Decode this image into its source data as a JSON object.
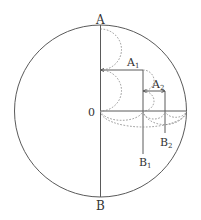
{
  "diagram": {
    "colors": {
      "stroke": "#5a5a5a",
      "dashed": "#8a8a8a",
      "text": "#333333",
      "background": "#ffffff"
    },
    "labels": {
      "A": "A",
      "B": "B",
      "O": "0",
      "A1_base": "A",
      "A1_sub": "1",
      "A2_base": "A",
      "A2_sub": "2",
      "B1_base": "B",
      "B1_sub": "1",
      "B2_base": "B",
      "B2_sub": "2"
    }
  }
}
